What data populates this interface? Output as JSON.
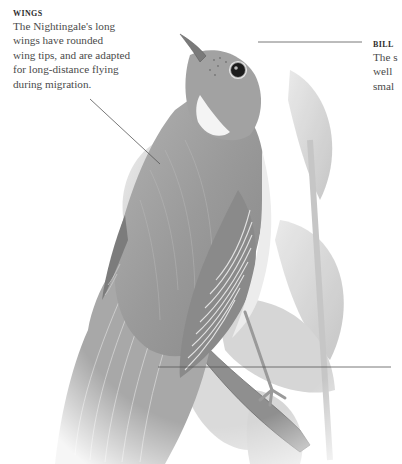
{
  "diagram": {
    "subject": "Nightingale",
    "callouts": {
      "wings": {
        "title": "WINGS",
        "body": "The Nightingale's long\nwings have rounded\nwing tips, and are adapted\nfor long-distance flying\nduring migration."
      },
      "bill": {
        "title": "BILL",
        "body": "The s\nwell \nsmal"
      }
    },
    "leader_lines": [
      {
        "name": "wings-leader",
        "from": [
          90,
          99
        ],
        "to": [
          160,
          164
        ]
      },
      {
        "name": "bill-leader",
        "from": [
          258,
          42
        ],
        "to": [
          362,
          42
        ]
      },
      {
        "name": "third-leader",
        "from": [
          158,
          367
        ],
        "to": [
          391,
          367
        ]
      }
    ],
    "colors": {
      "background": "#ffffff",
      "text": "#4a4a4a",
      "title": "#2e2e2e",
      "leader": "#555555",
      "bird_body": "#9a9a9a",
      "bird_dark": "#6a6a6a",
      "bird_light": "#d8d8d8",
      "leaf": "#c9c9c9"
    }
  }
}
